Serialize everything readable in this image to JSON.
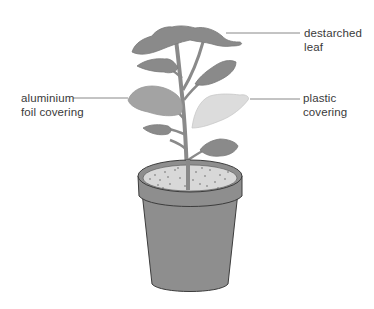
{
  "diagram": {
    "labels": {
      "destarched_leaf": {
        "line1": "destarched",
        "line2": "leaf"
      },
      "aluminium_foil": {
        "line1": "aluminium",
        "line2": "foil covering"
      },
      "plastic_covering": {
        "line1": "plastic",
        "line2": "covering"
      }
    },
    "colors": {
      "leaf": "#8a8a8a",
      "foil_leaf": "#a3a3a3",
      "plastic_leaf": "#dcdcdc",
      "pot": "#8e8e8e",
      "pot_outline": "#3c3c3c",
      "soil": "#d8d8d8",
      "leader_line": "#6a6a6a"
    }
  }
}
